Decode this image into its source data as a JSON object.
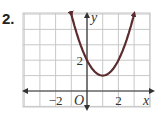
{
  "problem_label": "2.",
  "chart_data": {
    "type": "line",
    "title": "",
    "function": "y = (x - 1)^2 + 1",
    "series": [
      {
        "name": "parabola",
        "x": [
          -1,
          -0.5,
          0,
          0.5,
          1,
          1.5,
          2,
          2.5,
          3
        ],
        "y": [
          5,
          3.25,
          2,
          1.25,
          1,
          1.25,
          2,
          3.25,
          5
        ]
      }
    ],
    "vertex": [
      1,
      1
    ],
    "y_intercept": 2,
    "xlabel": "x",
    "ylabel": "y",
    "origin_label": "O",
    "xlim": [
      -4,
      4
    ],
    "ylim": [
      -1,
      5
    ],
    "x_tick_labels": [
      {
        "value": -2,
        "label": "−2"
      },
      {
        "value": 2,
        "label": "2"
      }
    ],
    "y_tick_labels": [
      {
        "value": 2,
        "label": "2"
      }
    ],
    "grid": true,
    "arrows_on_curve_ends": true,
    "curve_color": "#5b2b2e"
  }
}
